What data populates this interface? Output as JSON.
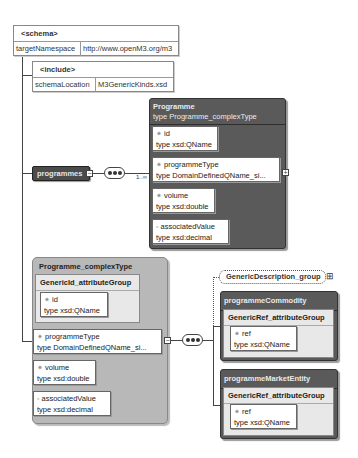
{
  "schema": {
    "title": "<schema>",
    "attr_name": "targetNamespace",
    "attr_value": "http://www.openM3.org/m3"
  },
  "include": {
    "title": "<include>",
    "attr_name": "schemaLocation",
    "attr_value": "M3GenericKinds.xsd"
  },
  "programmes": {
    "label": "programmes",
    "cardinality": "1..∞"
  },
  "programme_element": {
    "name": "Programme",
    "type_line": "type Programme_complexType",
    "attributes": [
      {
        "marker": "⁕",
        "name": "id",
        "type": "type xsd:QName"
      },
      {
        "marker": "⁕",
        "name": "programmeType",
        "type": "type DomainDefinedQName_si..."
      },
      {
        "marker": "⁕",
        "name": "volume",
        "type": "type xsd:double"
      },
      {
        "marker": "▫",
        "name": "associatedValue",
        "type": "type xsd:decimal"
      }
    ]
  },
  "complex_type": {
    "name": "Programme_complexType",
    "attribute_group": {
      "name": "GenericId_attributeGroup",
      "attribute": {
        "marker": "⁕",
        "name": "id",
        "type": "type xsd:QName"
      }
    },
    "attributes": [
      {
        "marker": "⁕",
        "name": "programmeType",
        "type": "type DomainDefinedQName_si..."
      },
      {
        "marker": "⁕",
        "name": "volume",
        "type": "type xsd:double"
      },
      {
        "marker": "▫",
        "name": "associatedValue",
        "type": "type xsd:decimal"
      }
    ]
  },
  "generic_description_group": {
    "label": "GenericDescription_group",
    "expand_icon": "⊞"
  },
  "programme_commodity": {
    "name": "programmeCommodity",
    "group": "GenericRef_attributeGroup",
    "attribute": {
      "marker": "⁕",
      "name": "ref",
      "type": "type xsd:QName"
    }
  },
  "programme_market_entity": {
    "name": "programmeMarketEntity",
    "group": "GenericRef_attributeGroup",
    "attribute": {
      "marker": "⁕",
      "name": "ref",
      "type": "type xsd:QName"
    }
  },
  "colors": {
    "dark_element": "#5a5a5a",
    "complex_type_bg": "#b8b8b8",
    "group_bg": "#e8e8e8"
  }
}
